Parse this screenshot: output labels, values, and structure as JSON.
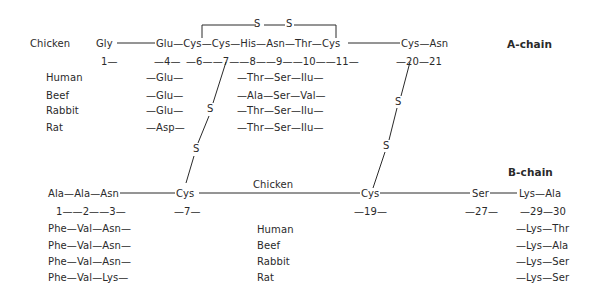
{
  "a_chain": {
    "label": "A-chain",
    "species_label": "Chicken",
    "chicken_sequence": {
      "gly": "Gly",
      "glu_cys_cys_his_asn_thr_cys": "Glu—Cys—Cys—His—Asn—Thr—Cys",
      "cys_asn": "Cys—Asn"
    },
    "positions": {
      "p1": "1—",
      "p4": "—4—",
      "p6_11": "—6——7——8——9——10——11—",
      "p20_21": "—20—21"
    },
    "intrachain_bridge": {
      "s1": "S",
      "s2": "S"
    },
    "variants": [
      {
        "species": "Human",
        "pos4": "—Glu—",
        "pos8_10": "—Thr—Ser—Ilu—"
      },
      {
        "species": "Beef",
        "pos4": "—Glu—",
        "pos8_10": "—Ala—Ser—Val—"
      },
      {
        "species": "Rabbit",
        "pos4": "—Glu—",
        "pos8_10": "—Thr—Ser—Ilu—"
      },
      {
        "species": "Rat",
        "pos4": "—Asp—",
        "pos8_10": "—Thr—Ser—Ilu—"
      }
    ]
  },
  "interchain_bridges": {
    "left": {
      "s1": "S",
      "s2": "S"
    },
    "right": {
      "s1": "S",
      "s2": "S"
    }
  },
  "b_chain": {
    "label": "B-chain",
    "species_label": "Chicken",
    "chicken_sequence": {
      "n_term": "Ala—Ala—Asn",
      "cys7": "Cys",
      "cys19": "Cys",
      "ser27": "Ser",
      "c_term": "Lys—Ala"
    },
    "positions": {
      "p1_3": "1——2——3—",
      "p7": "—7—",
      "p19": "—19—",
      "p27": "—27—",
      "p29_30": "—29—30"
    },
    "variants": [
      {
        "species": "Human",
        "pos1_3": "Phe—Val—Asn—",
        "pos29_30": "—Lys—Thr"
      },
      {
        "species": "Beef",
        "pos1_3": "Phe—Val—Asn—",
        "pos29_30": "—Lys—Ala"
      },
      {
        "species": "Rabbit",
        "pos1_3": "Phe—Val—Asn—",
        "pos29_30": "—Lys—Ser"
      },
      {
        "species": "Rat",
        "pos1_3": "Phe—Val—Lys—",
        "pos29_30": "—Lys—Ser"
      }
    ]
  }
}
